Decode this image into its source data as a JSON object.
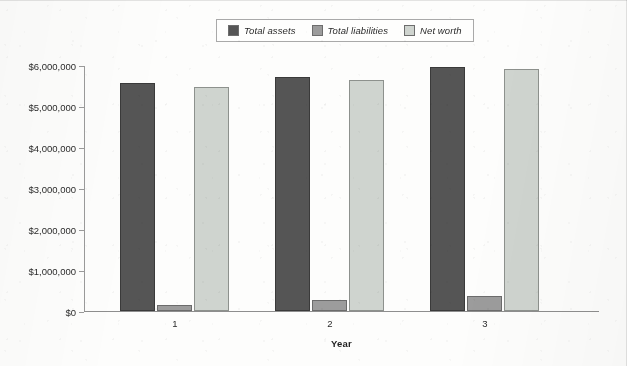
{
  "chart_data": {
    "type": "bar",
    "title": "",
    "subtitle": "",
    "xlabel": "Year",
    "ylabel": "",
    "categories": [
      "1",
      "2",
      "3"
    ],
    "series": [
      {
        "name": "Total assets",
        "color": "#555555",
        "values": [
          5560000,
          5710000,
          5950000
        ]
      },
      {
        "name": "Total liabilities",
        "color": "#9c9c9c",
        "values": [
          150000,
          270000,
          360000
        ]
      },
      {
        "name": "Net worth",
        "color": "#cfd4cf",
        "values": [
          5460000,
          5630000,
          5900000
        ]
      }
    ],
    "ylim": [
      0,
      6000000
    ],
    "ytick_values": [
      0,
      1000000,
      2000000,
      3000000,
      4000000,
      5000000,
      6000000
    ],
    "ytick_labels": [
      "$0",
      "$1,000,000",
      "$2,000,000",
      "$3,000,000",
      "$4,000,000",
      "$5,000,000",
      "$6,000,000"
    ],
    "xtick_labels": [
      "1",
      "2",
      "3"
    ],
    "grid": false,
    "legend_position": "top-center",
    "legend_boxed": true
  },
  "legend": {
    "items": [
      {
        "label": "Total assets"
      },
      {
        "label": "Total liabilities"
      },
      {
        "label": "Net worth"
      }
    ]
  },
  "axes": {
    "x_title": "Year"
  }
}
